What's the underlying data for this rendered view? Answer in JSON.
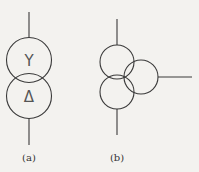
{
  "figures": [
    {
      "id": "a",
      "label": "(a)",
      "description": "two-winding transformer symbol",
      "windings": [
        {
          "symbol": "Y",
          "meaning": "wye (star) connection"
        },
        {
          "symbol": "Δ",
          "meaning": "delta connection"
        }
      ]
    },
    {
      "id": "b",
      "label": "(b)",
      "description": "three-winding transformer symbol",
      "windings": 3
    }
  ],
  "colors": {
    "line": "#3a3a3a",
    "background": "#f3f2ef"
  }
}
